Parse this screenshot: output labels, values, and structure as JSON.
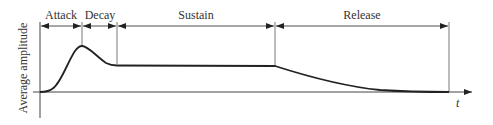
{
  "diagram": {
    "ylabel": "Average amplitude",
    "xlabel": "t",
    "phases": [
      {
        "label": "Attack",
        "x_start": 40,
        "x_end": 82
      },
      {
        "label": "Decay",
        "x_start": 82,
        "x_end": 117
      },
      {
        "label": "Sustain",
        "x_start": 117,
        "x_end": 275
      },
      {
        "label": "Release",
        "x_start": 275,
        "x_end": 449
      }
    ],
    "colors": {
      "line": "#222222",
      "text": "#333333",
      "axis": "#444444"
    }
  }
}
